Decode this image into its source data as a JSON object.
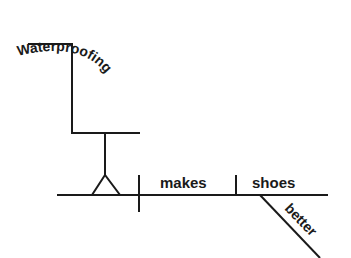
{
  "diagram": {
    "type": "Reed-Kellogg sentence diagram",
    "sentence": "Waterproofing makes shoes better",
    "subject": {
      "word": "Waterproofing",
      "role": "gerund subject on pedestal"
    },
    "verb": {
      "word": "makes"
    },
    "direct_object": {
      "word": "shoes"
    },
    "object_complement": {
      "word": "better"
    },
    "colors": {
      "ink": "#1a1a1a",
      "background": "#ffffff"
    }
  }
}
